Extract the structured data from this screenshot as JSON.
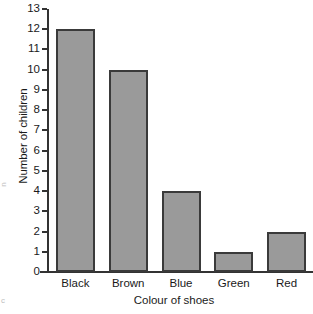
{
  "chart_data": {
    "type": "bar",
    "title": "",
    "xlabel": "Colour of shoes",
    "ylabel": "Number of children",
    "categories": [
      "Black",
      "Brown",
      "Blue",
      "Green",
      "Red"
    ],
    "values": [
      12,
      10,
      4,
      1,
      2
    ],
    "ylim": [
      0,
      13
    ],
    "ytick_labels": [
      "0",
      "1",
      "2",
      "3",
      "4",
      "5",
      "6",
      "7",
      "8",
      "9",
      "10",
      "11",
      "12",
      "13"
    ],
    "ytick_values": [
      0,
      1,
      2,
      3,
      4,
      5,
      6,
      7,
      8,
      9,
      10,
      11,
      12,
      13
    ],
    "grid": false,
    "legend": false,
    "legend_position": "none",
    "bar_fill_color": "#9a9a9a",
    "bar_edge_color": "#3a3a3a",
    "axis_color": "#333333",
    "background_color": "#ffffff",
    "text_color": "#1a1a1a"
  },
  "artifacts": {
    "left_margin_mark": "n",
    "bottom_margin_mark": "c"
  }
}
